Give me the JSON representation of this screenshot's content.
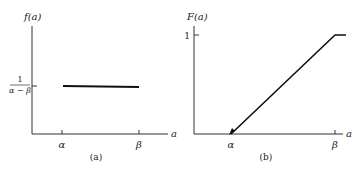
{
  "panels": [
    {
      "id": "a",
      "caption": "(a)",
      "ylabel": "f(a)",
      "xlabel": "a",
      "x_ticks": [
        "α",
        "β"
      ],
      "y_tick_numerator": "1",
      "y_tick_denominator": "α − β",
      "description": "Uniform probability density: constant value 1/(α−β) between α and β"
    },
    {
      "id": "b",
      "caption": "(b)",
      "ylabel": "F(a)",
      "xlabel": "a",
      "x_ticks": [
        "α",
        "β"
      ],
      "y_tick": "1",
      "description": "Cumulative distribution: rises linearly from 0 at α to 1 at β, then constant"
    }
  ],
  "colors": {
    "line": "#111111",
    "axis": "#333333",
    "background": "#ffffff"
  }
}
